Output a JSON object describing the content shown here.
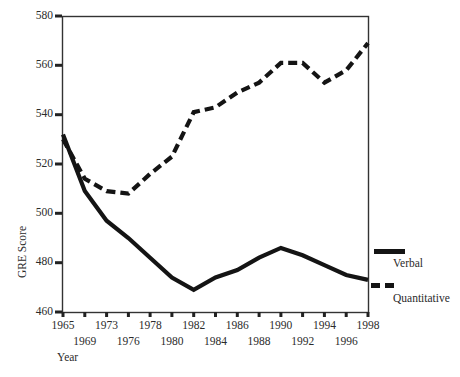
{
  "chart_data": {
    "type": "line",
    "title": "",
    "xlabel": "Year",
    "ylabel": "GRE Score",
    "x_years": [
      1965,
      1969,
      1973,
      1976,
      1978,
      1980,
      1982,
      1984,
      1986,
      1988,
      1990,
      1992,
      1994,
      1996,
      1998
    ],
    "x_label_rows": [
      "top",
      "bottom",
      "top",
      "bottom",
      "top",
      "bottom",
      "top",
      "bottom",
      "top",
      "bottom",
      "top",
      "bottom",
      "top",
      "bottom",
      "top"
    ],
    "ylim": [
      460,
      580
    ],
    "yticks": [
      460,
      480,
      500,
      520,
      540,
      560,
      580
    ],
    "grid": false,
    "legend_position": "right-outside",
    "line_color": "#141414",
    "frame_color": "#333333",
    "background_color": "#ffffff",
    "series": [
      {
        "name": "Verbal",
        "style": "solid",
        "values": [
          532,
          509,
          497,
          490,
          482,
          474,
          469,
          474,
          477,
          482,
          486,
          483,
          479,
          475,
          473
        ]
      },
      {
        "name": "Quantitative",
        "style": "dashed",
        "values": [
          530,
          514,
          509,
          508,
          516,
          523,
          541,
          543,
          549,
          553,
          561,
          561,
          553,
          558,
          569
        ]
      }
    ]
  }
}
